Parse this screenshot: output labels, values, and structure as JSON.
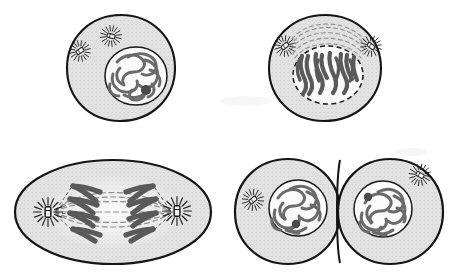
{
  "figure": {
    "style": "pen-and-ink textbook illustration",
    "background_color": "#ffffff",
    "width": 455,
    "height": 274,
    "layout": "2 rows x 2 columns of cell panels, no captions or labels rendered"
  },
  "colors": {
    "outline": "#151515",
    "cytoplasm_fill": "#e2e2e2",
    "cytoplasm_stipple": "#b9b9b9",
    "nucleus_fill": "#fbfbfb",
    "nucleus_outline": "#1a1a1a",
    "chromatin": "#6a6a6a",
    "chromosome": "#5a5a5a",
    "nucleolus": "#4a4a4a",
    "spindle_fiber": "#8d8d8d",
    "aster_ray": "#222222",
    "centriole_body": "#f2f2f2",
    "centriole_outline": "#111111",
    "watermark": "#ededed"
  },
  "panels": [
    {
      "id": "panel-prophase",
      "stage": "prophase",
      "position": "top-left",
      "cell_shape": "round",
      "cx": 121,
      "cy": 68,
      "rx": 54,
      "ry": 53,
      "nucleus": {
        "present": true,
        "cx": 136,
        "cy": 76,
        "rx": 31,
        "ry": 29,
        "envelope": "solid",
        "contents": "tangled chromatin threads",
        "nucleolus": {
          "cx": 146,
          "cy": 90,
          "r": 5
        }
      },
      "centrioles": [
        {
          "x": 80,
          "y": 51,
          "angle": -35,
          "aster": true
        },
        {
          "x": 111,
          "y": 36,
          "angle": 15,
          "aster": true
        }
      ],
      "spindle_visible": false,
      "chromosome_form": "chromatin threads"
    },
    {
      "id": "panel-metaphase",
      "stage": "metaphase",
      "position": "top-right",
      "cell_shape": "round",
      "cx": 325,
      "cy": 68,
      "rx": 56,
      "ry": 53,
      "nucleus": {
        "present": true,
        "cx": 328,
        "cy": 75,
        "rx": 35,
        "ry": 29,
        "envelope": "dashed",
        "contents": "condensed V-shaped chromosomes aligned vertically",
        "nucleolus": null
      },
      "centrioles": [
        {
          "x": 285,
          "y": 46,
          "angle": -40,
          "aster": true
        },
        {
          "x": 371,
          "y": 46,
          "angle": 40,
          "aster": true
        }
      ],
      "spindle_visible": true,
      "spindle_form": "arching dashed fibers over nucleus",
      "chromosome_form": "condensed chromosomes",
      "chromosome_count": 7
    },
    {
      "id": "panel-anaphase",
      "stage": "anaphase",
      "position": "bottom-left",
      "cell_shape": "oval elongated",
      "cx": 113,
      "cy": 212,
      "rx": 98,
      "ry": 52,
      "nucleus": {
        "present": false
      },
      "centrioles": [
        {
          "x": 48,
          "y": 212,
          "angle": 90,
          "aster": true
        },
        {
          "x": 176,
          "y": 210,
          "angle": 90,
          "aster": true
        }
      ],
      "spindle_visible": true,
      "spindle_form": "horizontal dashed fibers spanning poles",
      "chromosome_form": "V-shaped chromatids migrating to poles",
      "chromosome_groups": 2,
      "chromosomes_per_group": 4
    },
    {
      "id": "panel-telophase",
      "stage": "telophase / cytokinesis",
      "position": "bottom-right",
      "cell_shape": "two daughter cells with cleavage furrow",
      "daughter_cells": [
        {
          "cx": 288,
          "cy": 212,
          "rx": 53,
          "ry": 52,
          "nucleus": {
            "cx": 298,
            "cy": 208,
            "rx": 28,
            "ry": 27,
            "envelope": "solid",
            "contents": "decondensing chromatin threads",
            "nucleolus": {
              "cx": 296,
              "cy": 224,
              "r": 4
            }
          },
          "centrioles": [
            {
              "x": 253,
              "y": 200,
              "angle": -40,
              "aster": true
            }
          ]
        },
        {
          "cx": 390,
          "cy": 212,
          "rx": 53,
          "ry": 52,
          "nucleus": {
            "cx": 383,
            "cy": 209,
            "rx": 28,
            "ry": 27,
            "envelope": "solid",
            "contents": "decondensing chromatin threads",
            "nucleolus": {
              "cx": 368,
              "cy": 197,
              "r": 4
            }
          },
          "centrioles": [
            {
              "x": 420,
              "y": 175,
              "angle": 30,
              "aster": true
            }
          ]
        }
      ],
      "cleavage_furrow": true,
      "spindle_visible": false,
      "chromosome_form": "chromatin threads"
    }
  ],
  "watermark": {
    "present": true,
    "text": "",
    "note": "faint scanning artifact near center-top, no legible characters"
  }
}
